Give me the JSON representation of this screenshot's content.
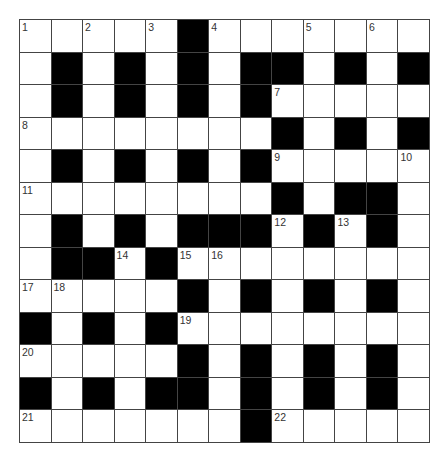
{
  "puzzle": {
    "type": "crossword",
    "rows": 13,
    "cols": 13,
    "colors": {
      "block": "#000000",
      "cell": "#ffffff",
      "line": "#444444",
      "number": "#333333"
    },
    "layout": [
      "WWWWWBWWWWWWW",
      "WBWBWBWBBWBWB",
      "WBWBWBWBWWWWW",
      "WWWWWWWWBWBWB",
      "WBWBWBWBWWWWW",
      "WWWWWWWWBWBBW",
      "WBWBWBBBWBWBW",
      "WBBWBWWWWWWWW",
      "WWWWWBWBWBWBW",
      "BWBWBWWWWWWWW",
      "WWWWWBWBWBWBW",
      "BWBWBBWBWBWBW",
      "WWWWWWWBWWWWW"
    ],
    "numbers": [
      {
        "r": 0,
        "c": 0,
        "n": "1"
      },
      {
        "r": 0,
        "c": 2,
        "n": "2"
      },
      {
        "r": 0,
        "c": 4,
        "n": "3"
      },
      {
        "r": 0,
        "c": 6,
        "n": "4"
      },
      {
        "r": 0,
        "c": 9,
        "n": "5"
      },
      {
        "r": 0,
        "c": 11,
        "n": "6"
      },
      {
        "r": 2,
        "c": 8,
        "n": "7"
      },
      {
        "r": 3,
        "c": 0,
        "n": "8"
      },
      {
        "r": 4,
        "c": 8,
        "n": "9"
      },
      {
        "r": 4,
        "c": 12,
        "n": "10"
      },
      {
        "r": 5,
        "c": 0,
        "n": "11"
      },
      {
        "r": 6,
        "c": 8,
        "n": "12"
      },
      {
        "r": 6,
        "c": 10,
        "n": "13"
      },
      {
        "r": 7,
        "c": 3,
        "n": "14"
      },
      {
        "r": 7,
        "c": 5,
        "n": "15"
      },
      {
        "r": 7,
        "c": 6,
        "n": "16"
      },
      {
        "r": 8,
        "c": 0,
        "n": "17"
      },
      {
        "r": 8,
        "c": 1,
        "n": "18"
      },
      {
        "r": 9,
        "c": 5,
        "n": "19"
      },
      {
        "r": 10,
        "c": 0,
        "n": "20"
      },
      {
        "r": 12,
        "c": 0,
        "n": "21"
      },
      {
        "r": 12,
        "c": 8,
        "n": "22"
      }
    ]
  }
}
